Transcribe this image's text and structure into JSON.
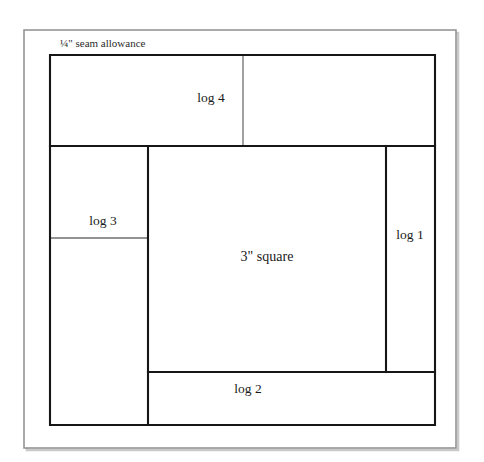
{
  "document": {
    "title": "Log Cabin quilt block piecing diagram",
    "background_color": "#ffffff",
    "line_color": "#161616",
    "light_line_color": "#6f6f6f",
    "outer_border_color": "#8e8e8e"
  },
  "annotations": {
    "seam_allowance": "¼\" seam allowance"
  },
  "patches": [
    {
      "id": "center-square",
      "label": "3\" square",
      "role": "center"
    },
    {
      "id": "log-1",
      "label": "log 1",
      "role": "log"
    },
    {
      "id": "log-2",
      "label": "log 2",
      "role": "log"
    },
    {
      "id": "log-3",
      "label": "log 3",
      "role": "log"
    },
    {
      "id": "log-4",
      "label": "log 4",
      "role": "log"
    }
  ]
}
